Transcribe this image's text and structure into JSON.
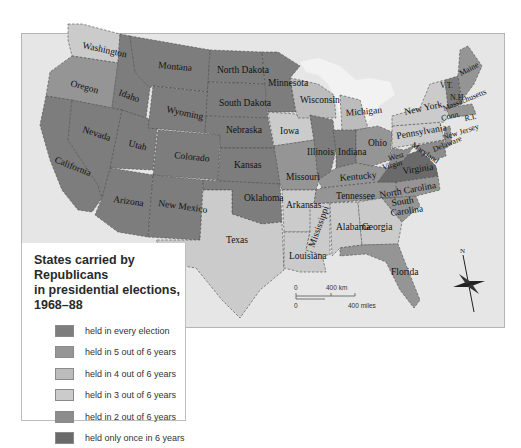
{
  "map": {
    "title": "States carried by Republicans in presidential elections, 1968–88",
    "title_lines": [
      "States carried by Republicans",
      "in presidential elections,",
      "1968–88"
    ],
    "categories": {
      "every": {
        "label": "held in every election",
        "color": "#7d7d7d"
      },
      "five": {
        "label": "held in 5 out of 6 years",
        "color": "#959595"
      },
      "four": {
        "label": "held in 4 out of 6 years",
        "color": "#bcbcbc"
      },
      "three": {
        "label": "held in 3 out of 6 years",
        "color": "#cbcbcb"
      },
      "two": {
        "label": "held in 2 out of 6 years",
        "color": "#8c8c8c"
      },
      "once": {
        "label": "held only once in 6 years",
        "color": "#6a6a6a"
      }
    },
    "legend": [
      {
        "label": "held in every election",
        "color": "#7d7d7d"
      },
      {
        "label": "held in 5 out of 6 years",
        "color": "#959595"
      },
      {
        "label": "held in 4 out of 6 years",
        "color": "#bcbcbc"
      },
      {
        "label": "held in 3 out of 6 years",
        "color": "#cbcbcb"
      },
      {
        "label": "held in 2 out of 6 years",
        "color": "#8c8c8c"
      },
      {
        "label": "held only once in 6 years",
        "color": "#6a6a6a"
      }
    ],
    "state_labels": {
      "washington": "Washington",
      "oregon": "Oregon",
      "california": "California",
      "idaho": "Idaho",
      "nevada": "Nevada",
      "utah": "Utah",
      "arizona": "Arizona",
      "montana": "Montana",
      "wyoming": "Wyoming",
      "colorado": "Colorado",
      "new_mexico": "New Mexico",
      "north_dakota": "North Dakota",
      "south_dakota": "South Dakota",
      "nebraska": "Nebraska",
      "kansas": "Kansas",
      "oklahoma": "Oklahoma",
      "texas": "Texas",
      "minnesota": "Minnesota",
      "iowa": "Iowa",
      "missouri": "Missouri",
      "arkansas": "Arkansas",
      "louisiana": "Louisiana",
      "wisconsin": "Wisconsin",
      "illinois": "Illinois",
      "michigan": "Michigan",
      "indiana": "Indiana",
      "ohio": "Ohio",
      "kentucky": "Kentucky",
      "tennessee": "Tennessee",
      "mississippi": "Mississippi",
      "alabama": "Alabama",
      "georgia": "Georgia",
      "florida": "Florida",
      "south_carolina_1": "South",
      "south_carolina_2": "Carolina",
      "north_carolina": "North Carolina",
      "virginia": "Virginia",
      "west_virginia_1": "West",
      "west_virginia_2": "Virgin",
      "pennsylvania": "Pennsylvania",
      "new_york": "New York",
      "maryland": "Maryland",
      "delaware": "Delaware",
      "new_jersey": "New Jersey",
      "connecticut": "Conn.",
      "rhode_island": "R.I.",
      "massachusetts": "Massachusetts",
      "vermont": "V.T.",
      "new_hampshire": "N.H",
      "maine": "Maine"
    },
    "scale": {
      "km_start": "0",
      "km_label": "400 km",
      "mi_start": "0",
      "mi_label": "400 miles"
    },
    "compass": {
      "label": "N"
    }
  }
}
